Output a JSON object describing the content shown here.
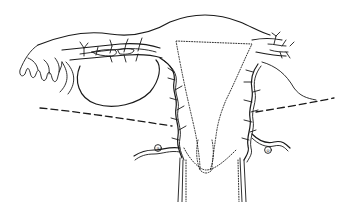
{
  "figure": {
    "type": "anatomical line drawing",
    "colors": {
      "ink": "#1a1a1a",
      "background": "#ffffff"
    },
    "labels": [
      {
        "id": "left-marker",
        "text": "a"
      },
      {
        "id": "right-marker",
        "text": "o"
      }
    ]
  }
}
